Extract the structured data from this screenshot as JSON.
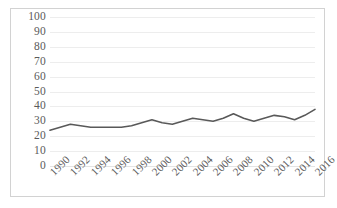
{
  "chart_data": {
    "type": "line",
    "title": "",
    "subtitle": "",
    "xlabel": "",
    "ylabel": "",
    "xlim": [
      1990,
      2016
    ],
    "ylim": [
      0,
      100
    ],
    "grid": true,
    "legend": false,
    "legend_position": "none",
    "y_ticks": [
      100,
      90,
      80,
      70,
      60,
      50,
      40,
      30,
      20,
      10,
      0
    ],
    "y_tick_labels": [
      "100",
      "90",
      "80",
      "70",
      "60",
      "50",
      "40",
      "30",
      "20",
      "10",
      "0"
    ],
    "x_tick_labels": [
      "1990",
      "1992",
      "1994",
      "1996",
      "1998",
      "2000",
      "2002",
      "2004",
      "2006",
      "2008",
      "2010",
      "2012",
      "2014",
      "2016"
    ],
    "x_tick_interval": 2,
    "x": [
      1990,
      1991,
      1992,
      1993,
      1994,
      1995,
      1996,
      1997,
      1998,
      1999,
      2000,
      2001,
      2002,
      2003,
      2004,
      2005,
      2006,
      2007,
      2008,
      2009,
      2010,
      2011,
      2012,
      2013,
      2014,
      2015,
      2016
    ],
    "values": [
      24,
      26,
      28,
      27,
      26,
      26,
      26,
      26,
      27,
      29,
      31,
      29,
      28,
      30,
      32,
      31,
      30,
      32,
      35,
      32,
      30,
      32,
      34,
      33,
      31,
      34,
      38
    ],
    "series": [
      {
        "name": "Series 1",
        "color": "#595959",
        "values": [
          24,
          26,
          28,
          27,
          26,
          26,
          26,
          26,
          27,
          29,
          31,
          29,
          28,
          30,
          32,
          31,
          30,
          32,
          35,
          32,
          30,
          32,
          34,
          33,
          31,
          34,
          38
        ]
      }
    ],
    "colors": {
      "line": "#595959",
      "grid": "#ededed",
      "frame": "#d2d2d2",
      "tick_text": "#5a5a5a",
      "background": "#ffffff"
    }
  }
}
